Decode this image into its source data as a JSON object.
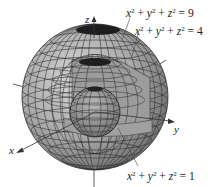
{
  "figure": {
    "axes": {
      "x_label": "x",
      "y_label": "y",
      "z_label": "z"
    },
    "spheres": [
      {
        "name": "outer",
        "radius": 3,
        "equation": "x² + y² + z² = 9",
        "eq_parts": {
          "lhs": [
            "x",
            "y",
            "z"
          ],
          "rhs": "9"
        }
      },
      {
        "name": "middle",
        "radius": 2,
        "equation": "x² + y² + z² = 4",
        "eq_parts": {
          "lhs": [
            "x",
            "y",
            "z"
          ],
          "rhs": "4"
        }
      },
      {
        "name": "inner",
        "radius": 1,
        "equation": "x² + y² + z² = 1",
        "eq_parts": {
          "lhs": [
            "x",
            "y",
            "z"
          ],
          "rhs": "1"
        }
      }
    ],
    "colors": {
      "surface_light": "#b9b9b9",
      "surface_mid": "#8e8e8e",
      "surface_dark": "#3a3a3a",
      "grid_line": "#2a2a2a",
      "axis": "#333333",
      "text": "#222222"
    }
  }
}
